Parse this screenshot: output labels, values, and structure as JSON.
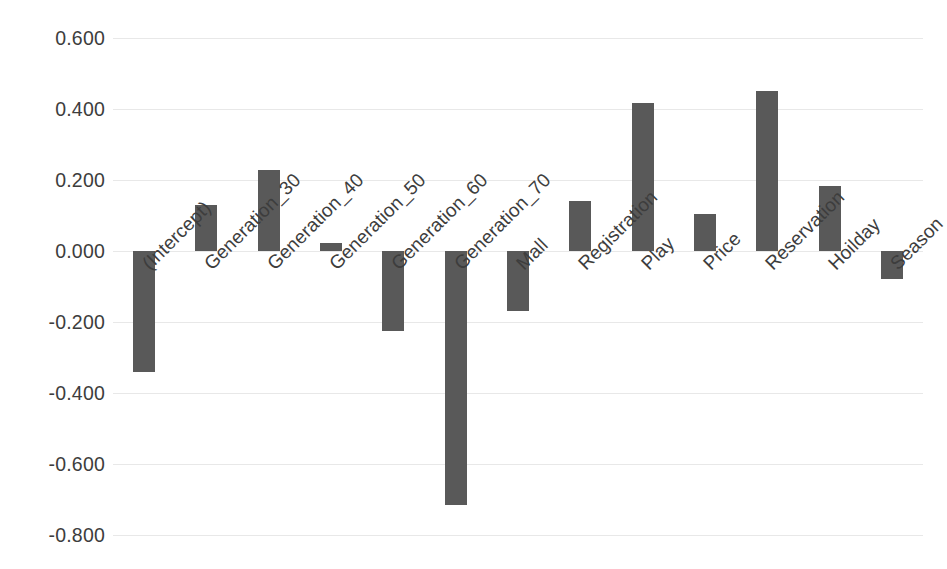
{
  "chart_data": {
    "type": "bar",
    "title": "",
    "subtitle": "",
    "xlabel": "",
    "ylabel": "",
    "grid": true,
    "legend": false,
    "bar_color": "#595959",
    "gridline_color": "#e8e8e8",
    "ylim": [
      -0.8,
      0.6
    ],
    "ytick_labels": [
      "0.600",
      "0.400",
      "0.200",
      "0.000",
      "-0.200",
      "-0.400",
      "-0.600",
      "-0.800"
    ],
    "ytick_values": [
      0.6,
      0.4,
      0.2,
      0.0,
      -0.2,
      -0.4,
      -0.6,
      -0.8
    ],
    "categories": [
      "(Intercept)",
      "Generation_30",
      "Generation_40",
      "Generation_50",
      "Generation_60",
      "Generation_70",
      "Mall",
      "Registration",
      "Play",
      "Price",
      "Reservation",
      "Hoilday",
      "Season"
    ],
    "values": [
      -0.341,
      0.13,
      0.228,
      0.023,
      -0.225,
      -0.715,
      -0.169,
      0.141,
      0.417,
      0.104,
      0.451,
      0.183,
      -0.079
    ]
  }
}
